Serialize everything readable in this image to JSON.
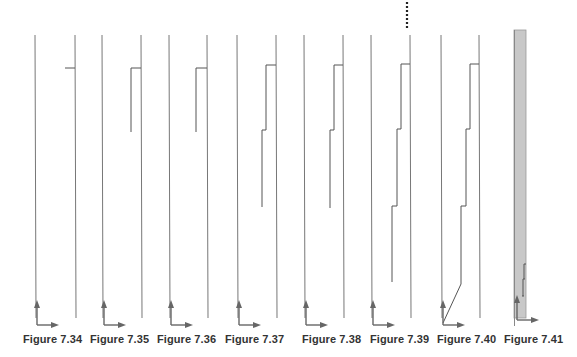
{
  "figure_series": {
    "line_color": "#777777",
    "step_color": "#555555",
    "arrow_color": "#666666",
    "shade_color": "#c8c8c8",
    "dotted_marker": {
      "x": 407,
      "y_start": 2,
      "y_end": 30
    },
    "figures": [
      {
        "label": "Figure 7.34",
        "caption_x": 23,
        "left_x": 35,
        "right_x": 75,
        "steps": [
          {
            "x_from": 65,
            "x_to": 75,
            "y": 68
          }
        ],
        "drop": null,
        "diagonal": null,
        "shaded": false
      },
      {
        "label": "Figure 7.35",
        "caption_x": 90,
        "left_x": 102,
        "right_x": 141,
        "steps": [
          {
            "x_from": 131,
            "x_to": 141,
            "y": 68
          }
        ],
        "drop": {
          "x": 131,
          "y_from": 68,
          "y_to": 132
        },
        "diagonal": null,
        "shaded": false
      },
      {
        "label": "Figure 7.36",
        "caption_x": 157,
        "left_x": 169,
        "right_x": 207,
        "steps": [
          {
            "x_from": 196,
            "x_to": 207,
            "y": 68
          }
        ],
        "drop": {
          "x": 196,
          "y_from": 68,
          "y_to": 132
        },
        "diagonal": null,
        "shaded": false
      },
      {
        "label": "Figure 7.37",
        "caption_x": 225,
        "left_x": 237,
        "right_x": 276,
        "steps": [
          {
            "x_from": 266,
            "x_to": 276,
            "y": 65
          },
          {
            "x_from": 262,
            "x_to": 266,
            "y": 130
          }
        ],
        "drop": {
          "x": 262,
          "y_from": 130,
          "y_to": 207
        },
        "diagonal": null,
        "shaded": false
      },
      {
        "label": "Figure 7.38",
        "caption_x": 302,
        "left_x": 304,
        "right_x": 343,
        "steps": [
          {
            "x_from": 334,
            "x_to": 343,
            "y": 65
          },
          {
            "x_from": 330,
            "x_to": 334,
            "y": 130
          }
        ],
        "drop": {
          "x": 330,
          "y_from": 130,
          "y_to": 208
        },
        "diagonal": null,
        "shaded": false
      },
      {
        "label": "Figure 7.39",
        "caption_x": 370,
        "left_x": 371,
        "right_x": 410,
        "steps": [
          {
            "x_from": 401,
            "x_to": 410,
            "y": 64
          },
          {
            "x_from": 397,
            "x_to": 401,
            "y": 129
          },
          {
            "x_from": 392,
            "x_to": 397,
            "y": 206
          }
        ],
        "drop": {
          "x": 392,
          "y_from": 206,
          "y_to": 282
        },
        "diagonal": null,
        "shaded": false
      },
      {
        "label": "Figure 7.40",
        "caption_x": 437,
        "left_x": 441,
        "right_x": 479,
        "steps": [
          {
            "x_from": 470,
            "x_to": 479,
            "y": 64
          },
          {
            "x_from": 466,
            "x_to": 470,
            "y": 129
          },
          {
            "x_from": 461,
            "x_to": 466,
            "y": 206
          }
        ],
        "drop": {
          "x": 461,
          "y_from": 206,
          "y_to": 284
        },
        "diagonal": {
          "x1": 461,
          "y1": 284,
          "x2": 443,
          "y2": 323
        },
        "shaded": false
      },
      {
        "label": "Figure 7.41",
        "caption_x": 504,
        "left_x": 515,
        "right_x": 525,
        "steps": [
          {
            "x_from": 524,
            "x_to": 526,
            "y": 264
          },
          {
            "x_from": 523,
            "x_to": 525,
            "y": 279
          },
          {
            "x_from": 522,
            "x_to": 524,
            "y": 296
          }
        ],
        "drop": null,
        "diagonal": null,
        "shaded": true,
        "shade": {
          "x": 514,
          "y_top": 30,
          "width": 12,
          "y_bottom": 318
        }
      }
    ]
  }
}
